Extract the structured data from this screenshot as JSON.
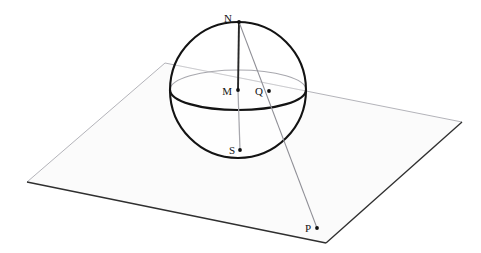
{
  "figure": {
    "canvas": {
      "width": 481,
      "height": 253
    },
    "background_color": "#ffffff"
  },
  "colors": {
    "outline": "#141414",
    "sphere_stroke": "#1a1a1a",
    "plane_stroke": "#3a3a3a",
    "plane_fill": "#fbfbfb",
    "hidden_stroke": "#9a9aa0",
    "projection_ray": "#8f8f96",
    "axis_visible": "#2b2b2b",
    "axis_hidden": "#a9a9af",
    "label_text": "#141414",
    "point_dot": "#111111"
  },
  "sphere": {
    "center": {
      "x": 238,
      "y": 90
    },
    "radius": 68,
    "equator_ry": 20,
    "stroke_width": 2.1
  },
  "plane": {
    "vertices": [
      {
        "x": 165,
        "y": 63
      },
      {
        "x": 462,
        "y": 122
      },
      {
        "x": 326,
        "y": 243
      },
      {
        "x": 27,
        "y": 182
      }
    ],
    "stroke_width": 1.0
  },
  "points": [
    {
      "id": "N",
      "label": "N",
      "label_x": 232,
      "label_y": 22,
      "dot_x": 239,
      "dot_y": 22,
      "role": "north-pole"
    },
    {
      "id": "M",
      "label": "M",
      "label_x": 228,
      "label_y": 95,
      "dot_x": 238,
      "dot_y": 90,
      "role": "sphere-center"
    },
    {
      "id": "Q",
      "label": "Q",
      "label_x": 259,
      "label_y": 95,
      "dot_x": 269,
      "dot_y": 91,
      "role": "point-on-sphere"
    },
    {
      "id": "S",
      "label": "S",
      "label_x": 231,
      "label_y": 153,
      "dot_x": 240,
      "dot_y": 150,
      "role": "south-pole"
    },
    {
      "id": "P",
      "label": "P",
      "label_x": 305,
      "label_y": 232,
      "dot_x": 317,
      "dot_y": 228,
      "role": "projected-image-point"
    }
  ],
  "segments": [
    {
      "id": "axis-upper",
      "from": "N",
      "to": "M",
      "style": "solid-dark",
      "note": "polar axis, visible upper half"
    },
    {
      "id": "axis-lower",
      "from": "M",
      "to": "S",
      "style": "solid-light",
      "note": "polar axis, lower half"
    },
    {
      "id": "projection-ray",
      "from": "N",
      "to": "P",
      "style": "thin-grey",
      "note": "ray from north pole through Q to plane point P"
    }
  ],
  "label_texts": {
    "north_pole": "N",
    "center": "M",
    "sphere_point": "Q",
    "south_pole": "S",
    "plane_point": "P"
  }
}
